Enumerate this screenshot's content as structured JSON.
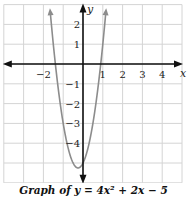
{
  "chart_data": {
    "type": "line",
    "title": "Graph of y = 4x² + 2x − 5",
    "equation": "y = 4x^2 + 2x - 5",
    "xlabel": "x",
    "ylabel": "y",
    "xlim": [
      -4,
      5
    ],
    "ylim": [
      -6,
      3
    ],
    "grid": true,
    "x_ticks": [
      -2,
      1,
      2,
      3,
      4
    ],
    "x_tick_labels": [
      "−2",
      "1",
      "2",
      "3",
      "4"
    ],
    "y_ticks": [
      2,
      1,
      -1,
      -2,
      -3,
      -4
    ],
    "y_tick_labels": [
      "2",
      "1",
      "−1",
      "−2",
      "−3",
      "−4"
    ],
    "series": [
      {
        "name": "y = 4x^2 + 2x - 5",
        "color": "#8c8c8c",
        "coefficients": {
          "a": 4,
          "b": 2,
          "c": -5
        },
        "vertex": [
          -0.25,
          -5.25
        ],
        "x_range": [
          -1.65,
          1.15
        ],
        "arrows_at_ends": true
      }
    ]
  },
  "caption": "Graph of y = 4x² + 2x − 5",
  "colors": {
    "grid": "#d4d4d4",
    "axis": "#111111",
    "curve": "#8c8c8c"
  }
}
